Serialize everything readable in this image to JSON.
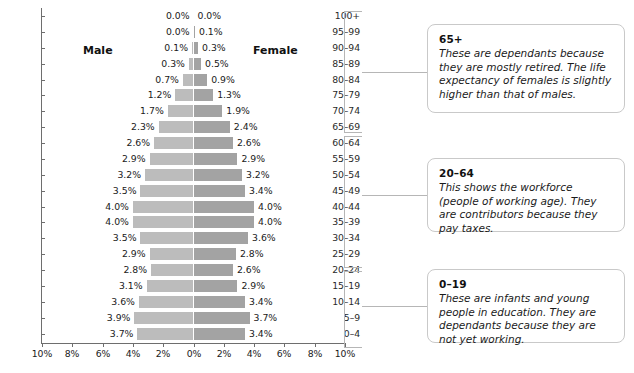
{
  "chart_data": {
    "type": "bar",
    "subtype": "population-pyramid",
    "title": "",
    "xlabel": "",
    "ylabel": "",
    "orientation": "horizontal",
    "grid": false,
    "legend_position": "inside-top",
    "axis_tick_labels": [
      "10%",
      "8%",
      "6%",
      "4%",
      "2%",
      "0%",
      "2%",
      "4%",
      "6%",
      "8%",
      "10%"
    ],
    "axis_tick_values": [
      -10,
      -8,
      -6,
      -4,
      -2,
      0,
      2,
      4,
      6,
      8,
      10
    ],
    "xlim": [
      -10,
      10
    ],
    "units": "percent",
    "series_names": [
      "Male",
      "Female"
    ],
    "categories": [
      "100+",
      "95–99",
      "90–94",
      "85–89",
      "80–84",
      "75–79",
      "70–74",
      "65–69",
      "60–64",
      "55–59",
      "50–54",
      "45–49",
      "40–44",
      "35–39",
      "30–34",
      "25–29",
      "20–24",
      "15–19",
      "10–14",
      "5–9",
      "0–4"
    ],
    "series": [
      {
        "name": "Male",
        "side": "left",
        "color": "#bcbcbc",
        "values": [
          0.0,
          0.0,
          0.1,
          0.3,
          0.7,
          1.2,
          1.7,
          2.3,
          2.6,
          2.9,
          3.2,
          3.5,
          4.0,
          4.0,
          3.5,
          2.9,
          2.8,
          3.1,
          3.6,
          3.9,
          3.7
        ],
        "labels": [
          "0.0%",
          "0.0%",
          "0.1%",
          "0.3%",
          "0.7%",
          "1.2%",
          "1.7%",
          "2.3%",
          "2.6%",
          "2.9%",
          "3.2%",
          "3.5%",
          "4.0%",
          "4.0%",
          "3.5%",
          "2.9%",
          "2.8%",
          "3.1%",
          "3.6%",
          "3.9%",
          "3.7%"
        ]
      },
      {
        "name": "Female",
        "side": "right",
        "color": "#a3a3a3",
        "values": [
          0.0,
          0.1,
          0.3,
          0.5,
          0.9,
          1.3,
          1.9,
          2.4,
          2.6,
          2.9,
          3.2,
          3.4,
          4.0,
          4.0,
          3.6,
          2.8,
          2.6,
          2.9,
          3.4,
          3.7,
          3.4
        ],
        "labels": [
          "0.0%",
          "0.1%",
          "0.3%",
          "0.5%",
          "0.9%",
          "1.3%",
          "1.9%",
          "2.4%",
          "2.6%",
          "2.9%",
          "3.2%",
          "3.4%",
          "4.0%",
          "4.0%",
          "3.6%",
          "2.8%",
          "2.6%",
          "2.9%",
          "3.4%",
          "3.7%",
          "3.4%"
        ]
      }
    ],
    "annotations": [
      {
        "id": "65plus",
        "title": "65+",
        "text": "These are dependants because they are mostly retired. The life expectancy of females is slightly higher than that of males.",
        "covers_categories": [
          "100+",
          "95–99",
          "90–94",
          "85–89",
          "80–84",
          "75–79",
          "70–74",
          "65–69"
        ]
      },
      {
        "id": "20to64",
        "title": "20–64",
        "text": "This shows the workforce (people of working age). They are contributors because they pay taxes.",
        "covers_categories": [
          "60–64",
          "55–59",
          "50–54",
          "45–49",
          "40–44",
          "35–39",
          "30–34",
          "25–29",
          "20–24"
        ]
      },
      {
        "id": "0to19",
        "title": "0–19",
        "text": "These are infants and young people in education. They are dependants because they are not yet working.",
        "covers_categories": [
          "15–19",
          "10–14",
          "5–9",
          "0–4"
        ]
      }
    ]
  },
  "labels": {
    "male": "Male",
    "female": "Female"
  },
  "colors": {
    "male_bar": "#bcbcbc",
    "female_bar": "#a3a3a3",
    "axis": "#6e6e6e",
    "bracket": "#b6b6b6",
    "card_border": "#c9c9c9",
    "text": "#1a1a1a"
  }
}
